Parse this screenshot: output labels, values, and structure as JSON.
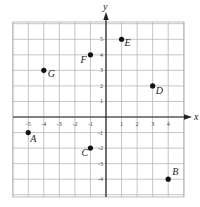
{
  "diagram": {
    "type": "coordinate-plane",
    "axes": {
      "x_label": "x",
      "y_label": "y",
      "x_ticks": [
        "-5",
        "-4",
        "-3",
        "-2",
        "-1",
        "1",
        "2",
        "3",
        "4"
      ],
      "y_ticks": [
        "5",
        "4",
        "3",
        "2",
        "1",
        "-1",
        "-2",
        "-3",
        "-4"
      ],
      "x_range": [
        -6,
        5
      ],
      "y_range": [
        -5,
        6
      ]
    },
    "points": [
      {
        "label": "A",
        "x": -5,
        "y": -1
      },
      {
        "label": "B",
        "x": 4,
        "y": -4
      },
      {
        "label": "C",
        "x": -1,
        "y": -2
      },
      {
        "label": "D",
        "x": 3,
        "y": 2
      },
      {
        "label": "E",
        "x": 1,
        "y": 5
      },
      {
        "label": "F",
        "x": -1,
        "y": 4
      },
      {
        "label": "G",
        "x": -4,
        "y": 3
      }
    ],
    "colors": {
      "grid": "#b8b8b8",
      "axis": "#222222",
      "point": "#111111"
    }
  }
}
